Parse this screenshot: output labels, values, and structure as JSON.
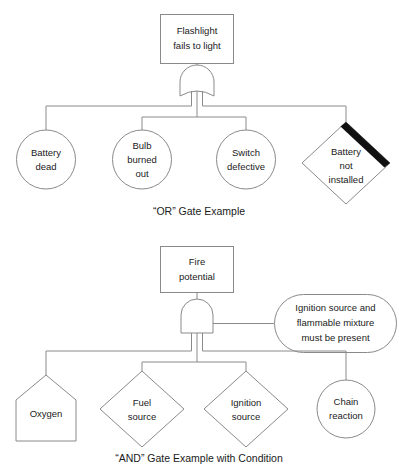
{
  "figure": {
    "line_color": "#8a8a8a",
    "band_color": "#111111",
    "text_color": "#1a1a1a",
    "background": "#ffffff"
  },
  "diagram_top": {
    "caption": "“OR” Gate Example",
    "gate_type": "OR",
    "top_event": {
      "shape": "rectangle",
      "line1": "Flashlight",
      "line2": "fails to light"
    },
    "children": [
      {
        "shape": "circle",
        "line1": "Battery",
        "line2": "dead",
        "line3": ""
      },
      {
        "shape": "circle",
        "line1": "Bulb",
        "line2": "burned",
        "line3": "out"
      },
      {
        "shape": "circle",
        "line1": "Switch",
        "line2": "defective",
        "line3": ""
      },
      {
        "shape": "diamond-with-band",
        "line1": "Battery",
        "line2": "not",
        "line3": "installed"
      }
    ]
  },
  "diagram_bottom": {
    "caption": "“AND” Gate Example with Condition",
    "gate_type": "AND",
    "top_event": {
      "shape": "rectangle",
      "line1": "Fire",
      "line2": "potential"
    },
    "condition": {
      "shape": "stadium",
      "line1": "Ignition source and",
      "line2": "flammable mixture",
      "line3": "must be present"
    },
    "children": [
      {
        "shape": "house",
        "line1": "Oxygen",
        "line2": "",
        "line3": ""
      },
      {
        "shape": "diamond",
        "line1": "Fuel",
        "line2": "source",
        "line3": ""
      },
      {
        "shape": "diamond",
        "line1": "Ignition",
        "line2": "source",
        "line3": ""
      },
      {
        "shape": "circle",
        "line1": "Chain",
        "line2": "reaction",
        "line3": ""
      }
    ]
  }
}
